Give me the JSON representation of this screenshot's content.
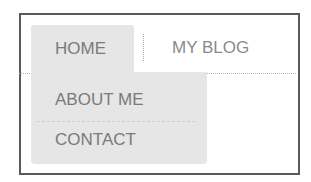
{
  "nav": {
    "tabs": [
      {
        "label": "HOME",
        "active": true
      },
      {
        "label": "MY BLOG",
        "active": false
      }
    ],
    "dropdown": {
      "items": [
        {
          "label": "ABOUT ME"
        },
        {
          "label": "CONTACT"
        }
      ]
    }
  },
  "colors": {
    "active_tab_bg": "#e6e6e6",
    "text": "#7a7a7a",
    "frame_border": "#5a5a5a"
  }
}
